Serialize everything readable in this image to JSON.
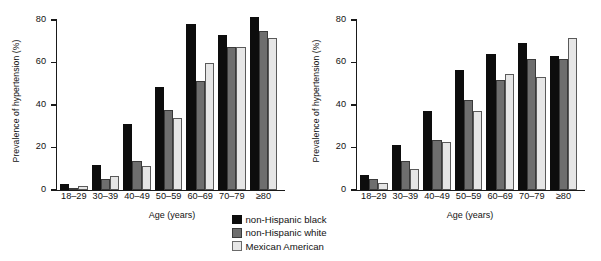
{
  "figure": {
    "legend": [
      {
        "name": "non-Hispanic black",
        "color": "#0d0d0d"
      },
      {
        "name": "non-Hispanic white",
        "color": "#6e6e6e"
      },
      {
        "name": "Mexican American",
        "color": "#e6e6e6"
      }
    ]
  },
  "chart_data": [
    {
      "type": "bar",
      "panel": "left",
      "title": "",
      "xlabel": "Age (years)",
      "ylabel": "Prevalence of hypertension (%)",
      "ylim": [
        0,
        80
      ],
      "yticks": [
        0,
        20,
        40,
        60,
        80
      ],
      "ytick_labels": [
        "0",
        "20",
        "40",
        "60",
        "80"
      ],
      "grid": false,
      "legend_position": "bottom-center",
      "categories": [
        "18–29",
        "30–39",
        "40–49",
        "50–59",
        "60–69",
        "70–79",
        "≥80"
      ],
      "series": [
        {
          "name": "non-Hispanic black",
          "color": "#0d0d0d",
          "values": [
            3,
            12,
            31,
            48.5,
            78,
            73,
            81.5
          ]
        },
        {
          "name": "non-Hispanic white",
          "color": "#6e6e6e",
          "values": [
            1,
            5,
            13.5,
            37.5,
            51.5,
            67.5,
            75
          ]
        },
        {
          "name": "Mexican American",
          "color": "#e6e6e6",
          "values": [
            2,
            6.5,
            11.5,
            34,
            60,
            67.5,
            71.5
          ]
        }
      ]
    },
    {
      "type": "bar",
      "panel": "right",
      "title": "",
      "xlabel": "Age (years)",
      "ylabel": "Prevalence of hypertension (%)",
      "ylim": [
        0,
        80
      ],
      "yticks": [
        0,
        20,
        40,
        60,
        80
      ],
      "ytick_labels": [
        "0",
        "20",
        "40",
        "60",
        "80"
      ],
      "grid": false,
      "legend_position": "bottom-center",
      "categories": [
        "18–29",
        "30–39",
        "40–49",
        "50–59",
        "60–69",
        "70–79",
        "≥80"
      ],
      "series": [
        {
          "name": "non-Hispanic black",
          "color": "#0d0d0d",
          "values": [
            7,
            21,
            37,
            56.5,
            64,
            69,
            63
          ]
        },
        {
          "name": "non-Hispanic white",
          "color": "#6e6e6e",
          "values": [
            5,
            13.5,
            23.5,
            42.5,
            52,
            61.5,
            61.5
          ]
        },
        {
          "name": "Mexican American",
          "color": "#e6e6e6",
          "values": [
            3.5,
            10,
            22.5,
            37,
            54.5,
            53,
            71.5
          ]
        }
      ]
    }
  ]
}
